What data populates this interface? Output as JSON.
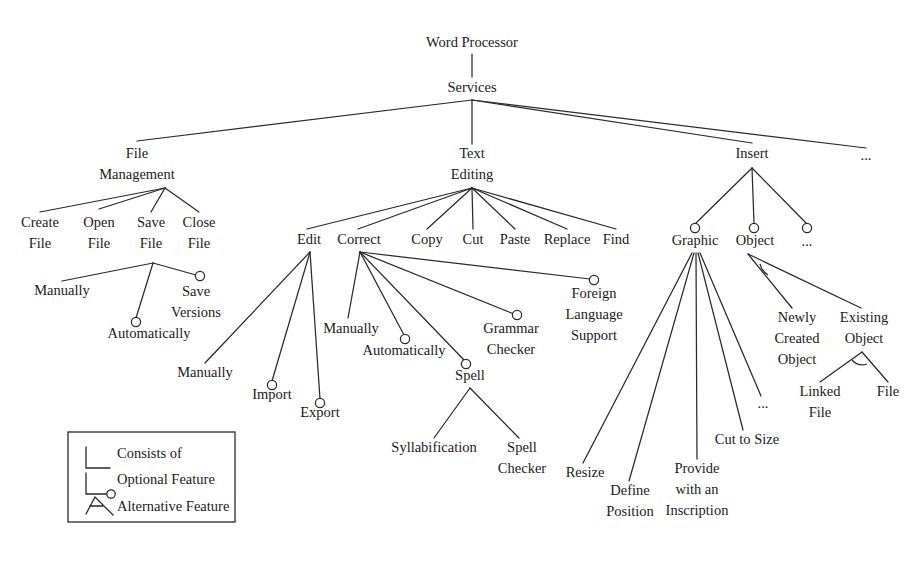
{
  "diagram": {
    "type": "feature-tree",
    "stroke_color": "#2a2a2a",
    "text_color": "#1b1b1b",
    "background_color": "#ffffff"
  },
  "nodes": {
    "root": {
      "label": "Word Processor",
      "x": 472,
      "y": 47
    },
    "services": {
      "label": "Services",
      "x": 472,
      "y": 92
    },
    "file_management_l1": {
      "label": "File",
      "x": 137,
      "y": 158
    },
    "file_management_l2": {
      "label": "Management",
      "x": 137,
      "y": 179
    },
    "text_editing_l1": {
      "label": "Text",
      "x": 472,
      "y": 158
    },
    "text_editing_l2": {
      "label": "Editing",
      "x": 472,
      "y": 179
    },
    "insert": {
      "label": "Insert",
      "x": 752,
      "y": 158
    },
    "services_more": {
      "label": "...",
      "x": 866,
      "y": 160
    },
    "create_file_l1": {
      "label": "Create",
      "x": 40,
      "y": 227
    },
    "create_file_l2": {
      "label": "File",
      "x": 40,
      "y": 248
    },
    "open_file_l1": {
      "label": "Open",
      "x": 99,
      "y": 227
    },
    "open_file_l2": {
      "label": "File",
      "x": 99,
      "y": 248
    },
    "save_file_l1": {
      "label": "Save",
      "x": 151,
      "y": 227
    },
    "save_file_l2": {
      "label": "File",
      "x": 151,
      "y": 248
    },
    "close_file_l1": {
      "label": "Close",
      "x": 199,
      "y": 227
    },
    "close_file_l2": {
      "label": "File",
      "x": 199,
      "y": 248
    },
    "save_manually": {
      "label": "Manually",
      "x": 62,
      "y": 295
    },
    "save_automatically": {
      "label": "Automatically",
      "x": 149,
      "y": 338
    },
    "save_versions_l1": {
      "label": "Save",
      "x": 196,
      "y": 296
    },
    "save_versions_l2": {
      "label": "Versions",
      "x": 196,
      "y": 317
    },
    "edit": {
      "label": "Edit",
      "x": 309,
      "y": 244
    },
    "correct": {
      "label": "Correct",
      "x": 359,
      "y": 244
    },
    "copy": {
      "label": "Copy",
      "x": 427,
      "y": 244
    },
    "cut": {
      "label": "Cut",
      "x": 473,
      "y": 244
    },
    "paste": {
      "label": "Paste",
      "x": 515,
      "y": 244
    },
    "replace": {
      "label": "Replace",
      "x": 567,
      "y": 244
    },
    "find": {
      "label": "Find",
      "x": 616,
      "y": 244
    },
    "edit_manually": {
      "label": "Manually",
      "x": 205,
      "y": 377
    },
    "edit_import": {
      "label": "Import",
      "x": 272,
      "y": 399
    },
    "edit_export": {
      "label": "Export",
      "x": 320,
      "y": 417
    },
    "correct_manually": {
      "label": "Manually",
      "x": 351,
      "y": 333
    },
    "correct_automatically": {
      "label": "Automatically",
      "x": 404,
      "y": 355
    },
    "spell": {
      "label": "Spell",
      "x": 470,
      "y": 380
    },
    "grammar_checker_l1": {
      "label": "Grammar",
      "x": 511,
      "y": 333
    },
    "grammar_checker_l2": {
      "label": "Checker",
      "x": 511,
      "y": 354
    },
    "foreign_lang_l1": {
      "label": "Foreign",
      "x": 594,
      "y": 298
    },
    "foreign_lang_l2": {
      "label": "Language",
      "x": 594,
      "y": 319
    },
    "foreign_lang_l3": {
      "label": "Support",
      "x": 594,
      "y": 340
    },
    "syllabification": {
      "label": "Syllabification",
      "x": 434,
      "y": 452
    },
    "spell_checker_l1": {
      "label": "Spell",
      "x": 522,
      "y": 452
    },
    "spell_checker_l2": {
      "label": "Checker",
      "x": 522,
      "y": 473
    },
    "graphic": {
      "label": "Graphic",
      "x": 695,
      "y": 245
    },
    "object": {
      "label": "Object",
      "x": 755,
      "y": 245
    },
    "insert_more": {
      "label": "...",
      "x": 807,
      "y": 246
    },
    "resize": {
      "label": "Resize",
      "x": 585,
      "y": 477
    },
    "define_position_l1": {
      "label": "Define",
      "x": 630,
      "y": 495
    },
    "define_position_l2": {
      "label": "Position",
      "x": 630,
      "y": 516
    },
    "provide_inscription_l1": {
      "label": "Provide",
      "x": 697,
      "y": 473
    },
    "provide_inscription_l2": {
      "label": "with an",
      "x": 697,
      "y": 494
    },
    "provide_inscription_l3": {
      "label": "Inscription",
      "x": 697,
      "y": 515
    },
    "cut_to_size": {
      "label": "Cut to Size",
      "x": 747,
      "y": 444
    },
    "graphic_more": {
      "label": "...",
      "x": 763,
      "y": 408
    },
    "newly_created_l1": {
      "label": "Newly",
      "x": 797,
      "y": 322
    },
    "newly_created_l2": {
      "label": "Created",
      "x": 797,
      "y": 343
    },
    "newly_created_l3": {
      "label": "Object",
      "x": 797,
      "y": 364
    },
    "existing_object_l1": {
      "label": "Existing",
      "x": 864,
      "y": 322
    },
    "existing_object_l2": {
      "label": "Object",
      "x": 864,
      "y": 343
    },
    "linked_file_l1": {
      "label": "Linked",
      "x": 820,
      "y": 396
    },
    "linked_file_l2": {
      "label": "File",
      "x": 820,
      "y": 417
    },
    "file_alt": {
      "label": "File",
      "x": 888,
      "y": 396
    }
  },
  "legend": {
    "box": {
      "x": 68,
      "y": 432,
      "width": 167,
      "height": 90
    },
    "items": [
      {
        "id": "consists-of",
        "label": "Consists of",
        "marker": "plain-line"
      },
      {
        "id": "optional-feature",
        "label": "Optional Feature",
        "marker": "line-with-circle"
      },
      {
        "id": "alternative-feature",
        "label": "Alternative Feature",
        "marker": "arc-between-lines"
      }
    ]
  },
  "tree": {
    "root": "Word Processor",
    "children": [
      {
        "label": "Services",
        "children": [
          {
            "label": "File Management",
            "relation": "mandatory",
            "children": [
              {
                "label": "Create File",
                "relation": "mandatory"
              },
              {
                "label": "Open File",
                "relation": "mandatory"
              },
              {
                "label": "Save File",
                "relation": "mandatory",
                "children": [
                  {
                    "label": "Manually",
                    "relation": "mandatory"
                  },
                  {
                    "label": "Automatically",
                    "relation": "optional"
                  },
                  {
                    "label": "Save Versions",
                    "relation": "optional"
                  }
                ]
              },
              {
                "label": "Close File",
                "relation": "mandatory"
              }
            ]
          },
          {
            "label": "Text Editing",
            "relation": "mandatory",
            "children": [
              {
                "label": "Edit",
                "relation": "mandatory",
                "children": [
                  {
                    "label": "Manually",
                    "relation": "mandatory"
                  },
                  {
                    "label": "Import",
                    "relation": "optional"
                  },
                  {
                    "label": "Export",
                    "relation": "optional"
                  }
                ]
              },
              {
                "label": "Correct",
                "relation": "mandatory",
                "children": [
                  {
                    "label": "Manually",
                    "relation": "mandatory"
                  },
                  {
                    "label": "Automatically",
                    "relation": "optional"
                  },
                  {
                    "label": "Spell",
                    "relation": "optional",
                    "children": [
                      {
                        "label": "Syllabification",
                        "relation": "mandatory"
                      },
                      {
                        "label": "Spell Checker",
                        "relation": "mandatory"
                      }
                    ]
                  },
                  {
                    "label": "Grammar Checker",
                    "relation": "optional"
                  },
                  {
                    "label": "Foreign Language Support",
                    "relation": "optional"
                  }
                ]
              },
              {
                "label": "Copy",
                "relation": "mandatory"
              },
              {
                "label": "Cut",
                "relation": "mandatory"
              },
              {
                "label": "Paste",
                "relation": "mandatory"
              },
              {
                "label": "Replace",
                "relation": "mandatory"
              },
              {
                "label": "Find",
                "relation": "mandatory"
              }
            ]
          },
          {
            "label": "Insert",
            "relation": "mandatory",
            "children": [
              {
                "label": "Graphic",
                "relation": "optional",
                "children": [
                  {
                    "label": "Resize",
                    "relation": "mandatory"
                  },
                  {
                    "label": "Define Position",
                    "relation": "mandatory"
                  },
                  {
                    "label": "Provide with an Inscription",
                    "relation": "mandatory"
                  },
                  {
                    "label": "Cut to Size",
                    "relation": "mandatory"
                  },
                  {
                    "label": "...",
                    "relation": "mandatory"
                  }
                ]
              },
              {
                "label": "Object",
                "relation": "optional",
                "children": [
                  {
                    "label": "Newly Created Object",
                    "relation": "alternative"
                  },
                  {
                    "label": "Existing Object",
                    "relation": "alternative",
                    "children": [
                      {
                        "label": "Linked File",
                        "relation": "alternative"
                      },
                      {
                        "label": "File",
                        "relation": "alternative"
                      }
                    ]
                  }
                ]
              },
              {
                "label": "...",
                "relation": "optional"
              }
            ]
          },
          {
            "label": "...",
            "relation": "mandatory"
          }
        ]
      }
    ]
  }
}
